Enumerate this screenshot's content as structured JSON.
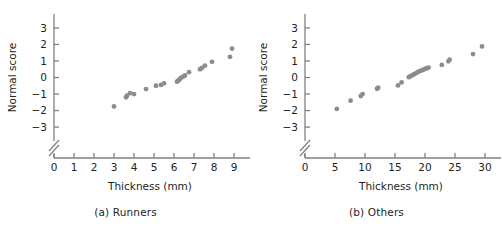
{
  "figure": {
    "name": "normal-probability-plots",
    "panel_count": 2,
    "point_color": "#8c8c8c",
    "axis_color": "#808080",
    "text_color": "#231f20"
  },
  "chart_data": [
    {
      "type": "scatter",
      "id": "panel-a",
      "title": "(a) Runners",
      "xlabel": "Thickness (mm)",
      "ylabel": "Normal score",
      "xlim": [
        0,
        9.6
      ],
      "ylim": [
        -3.6,
        3.6
      ],
      "xticks": [
        0,
        1,
        2,
        3,
        4,
        5,
        6,
        7,
        8,
        9
      ],
      "xticklabels": [
        "0",
        "1",
        "2",
        "3",
        "4",
        "5",
        "6",
        "7",
        "8",
        "9"
      ],
      "yticks": [
        -3,
        -2,
        -1,
        0,
        1,
        2,
        3
      ],
      "yticklabels": [
        "−3",
        "−2",
        "−1",
        "0",
        "1",
        "2",
        "3"
      ],
      "grid": false,
      "legend": "none",
      "axis_break": "y-axis broken below -3",
      "x": [
        3.0,
        3.6,
        3.65,
        3.8,
        4.0,
        4.6,
        5.1,
        5.35,
        5.5,
        6.15,
        6.2,
        6.25,
        6.3,
        6.35,
        6.45,
        6.55,
        6.75,
        7.3,
        7.4,
        7.55,
        7.9,
        8.8,
        8.9
      ],
      "y": [
        -1.75,
        -1.2,
        -1.1,
        -0.95,
        -1.0,
        -0.7,
        -0.5,
        -0.45,
        -0.35,
        -0.25,
        -0.2,
        -0.15,
        -0.08,
        -0.02,
        0.05,
        0.12,
        0.32,
        0.5,
        0.58,
        0.72,
        0.95,
        1.25,
        1.75
      ]
    },
    {
      "type": "scatter",
      "id": "panel-b",
      "title": "(b) Others",
      "xlabel": "Thickness (mm)",
      "ylabel": "Normal score",
      "xlim": [
        0,
        32
      ],
      "ylim": [
        -3.6,
        3.6
      ],
      "xticks": [
        0,
        5,
        10,
        15,
        20,
        25,
        30
      ],
      "xticklabels": [
        "0",
        "5",
        "10",
        "15",
        "20",
        "25",
        "30"
      ],
      "yticks": [
        -3,
        -2,
        -1,
        0,
        1,
        2,
        3
      ],
      "yticklabels": [
        "−3",
        "−2",
        "−1",
        "0",
        "1",
        "2",
        "3"
      ],
      "grid": false,
      "legend": "none",
      "axis_break": "y-axis broken below -3",
      "x": [
        5.3,
        7.6,
        9.3,
        9.6,
        12.0,
        12.2,
        15.5,
        16.1,
        17.3,
        17.6,
        17.9,
        18.2,
        18.5,
        18.8,
        19.1,
        19.4,
        19.7,
        20.0,
        20.3,
        20.6,
        22.8,
        23.9,
        24.1,
        28.0,
        29.5
      ],
      "y": [
        -1.9,
        -1.4,
        -1.12,
        -1.0,
        -0.68,
        -0.62,
        -0.48,
        -0.3,
        0.02,
        0.08,
        0.14,
        0.2,
        0.26,
        0.32,
        0.38,
        0.42,
        0.47,
        0.52,
        0.56,
        0.6,
        0.76,
        0.98,
        1.08,
        1.42,
        1.88
      ]
    }
  ],
  "captions": {
    "panel_a": "(a) Runners",
    "panel_b": "(b) Others"
  },
  "labels": {
    "xlabel": "Thickness (mm)",
    "ylabel": "Normal score"
  }
}
